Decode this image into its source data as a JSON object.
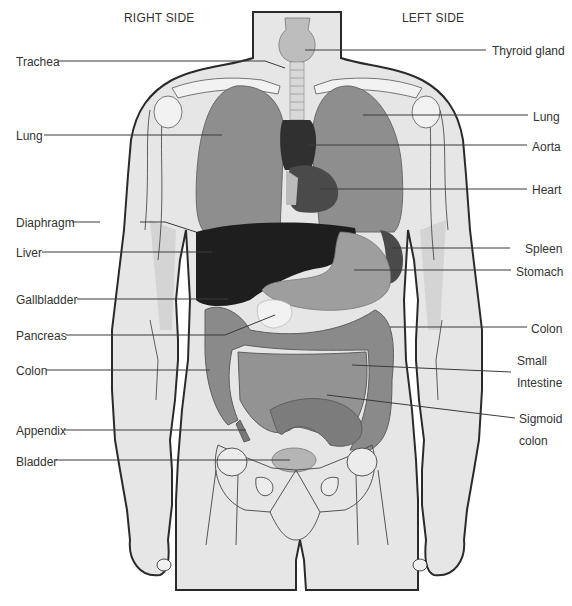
{
  "diagram": {
    "type": "anatomy",
    "headings": {
      "right_side": "RIGHT SIDE",
      "left_side": "LEFT SIDE"
    },
    "colors": {
      "background": "#ffffff",
      "skin": "#e6e6e6",
      "skin_shadow": "#d2d2d2",
      "outline": "#2a2a2a",
      "lung": "#8e8e8e",
      "liver": "#1e1e1e",
      "heart": "#3a3a3a",
      "stomach": "#9c9c9c",
      "intestine": "#8a8a8a",
      "bone": "#efefef",
      "leader_line": "#3a3a3a",
      "label_text": "#333333"
    },
    "labels_left": [
      {
        "id": "trachea",
        "text": "Trachea",
        "x": 16,
        "y": 55,
        "line": [
          [
            58,
            61
          ],
          [
            265,
            61
          ],
          [
            285,
            68
          ]
        ]
      },
      {
        "id": "lung-right",
        "text": "Lung",
        "x": 16,
        "y": 129,
        "line": [
          [
            44,
            135
          ],
          [
            222,
            135
          ]
        ]
      },
      {
        "id": "diaphragm",
        "text": "Diaphragm",
        "x": 16,
        "y": 216,
        "line": [
          [
            72,
            222
          ],
          [
            100,
            222
          ]
        ],
        "line2": [
          [
            140,
            222
          ],
          [
            165,
            222
          ],
          [
            196,
            232
          ]
        ]
      },
      {
        "id": "liver",
        "text": "Liver",
        "x": 16,
        "y": 246,
        "line": [
          [
            42,
            252
          ],
          [
            212,
            252
          ]
        ]
      },
      {
        "id": "gallbladder",
        "text": "Gallbladder",
        "x": 16,
        "y": 293,
        "line": [
          [
            77,
            299
          ],
          [
            228,
            299
          ]
        ]
      },
      {
        "id": "pancreas",
        "text": "Pancreas",
        "x": 16,
        "y": 329,
        "line": [
          [
            66,
            335
          ],
          [
            225,
            335
          ],
          [
            275,
            315
          ]
        ]
      },
      {
        "id": "colon-right",
        "text": "Colon",
        "x": 16,
        "y": 364,
        "line": [
          [
            46,
            370
          ],
          [
            210,
            370
          ]
        ]
      },
      {
        "id": "appendix",
        "text": "Appendix",
        "x": 16,
        "y": 424,
        "line": [
          [
            64,
            430
          ],
          [
            246,
            430
          ]
        ]
      },
      {
        "id": "bladder",
        "text": "Bladder",
        "x": 16,
        "y": 455,
        "line": [
          [
            56,
            460
          ],
          [
            290,
            460
          ]
        ]
      }
    ],
    "labels_right": [
      {
        "id": "thyroid-gland",
        "text": "Thyroid gland",
        "x": 492,
        "y": 44,
        "line": [
          [
            305,
            50
          ],
          [
            486,
            50
          ]
        ]
      },
      {
        "id": "lung-left",
        "text": "Lung",
        "x": 533,
        "y": 110,
        "line": [
          [
            363,
            115
          ],
          [
            528,
            115
          ]
        ]
      },
      {
        "id": "aorta",
        "text": "Aorta",
        "x": 532,
        "y": 140,
        "line": [
          [
            308,
            145
          ],
          [
            527,
            145
          ]
        ]
      },
      {
        "id": "heart",
        "text": "Heart",
        "x": 532,
        "y": 183,
        "line": [
          [
            320,
            189
          ],
          [
            527,
            189
          ]
        ]
      },
      {
        "id": "spleen",
        "text": "Spleen",
        "x": 525,
        "y": 242,
        "line": [
          [
            392,
            248
          ],
          [
            510,
            248
          ]
        ]
      },
      {
        "id": "stomach",
        "text": "Stomach",
        "x": 516,
        "y": 266,
        "line": [
          [
            354,
            270
          ],
          [
            511,
            270
          ]
        ]
      },
      {
        "id": "colon-left",
        "text": "Colon",
        "x": 531,
        "y": 322,
        "line": [
          [
            390,
            327
          ],
          [
            527,
            327
          ]
        ]
      },
      {
        "id": "small-intestine",
        "text": "Small\nIntestine",
        "lines": [
          "Small",
          "Intestine"
        ],
        "x": 517,
        "y": 354,
        "line": [
          [
            352,
            365
          ],
          [
            511,
            372
          ]
        ]
      },
      {
        "id": "sigmoid-colon",
        "text": "Sigmoid\ncolon",
        "lines": [
          "Sigmoid",
          "colon"
        ],
        "x": 519,
        "y": 412,
        "line": [
          [
            327,
            395
          ],
          [
            515,
            418
          ]
        ]
      }
    ]
  }
}
